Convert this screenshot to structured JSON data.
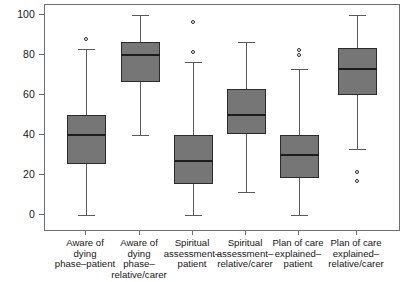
{
  "chart_data": {
    "type": "box",
    "title": "",
    "xlabel": "",
    "ylabel": "",
    "ylim": [
      0,
      100
    ],
    "yticks": [
      0,
      20,
      40,
      60,
      80,
      100
    ],
    "grid": false,
    "legend": "none",
    "categories": [
      "Aware of\ndying\nphase–patient",
      "Aware of\ndying\nphase–\nrelative/carer",
      "Spiritual\nassessment–\npatient",
      "Spiritual\nassessment–\nrelative/carer",
      "Plan of care\nexplained–\npatient",
      "Plan of care\nexplained–\nrelative/carer"
    ],
    "boxes": [
      {
        "name": "Aware of dying phase–patient",
        "whisker_low": 0,
        "q1": 25.5,
        "median": 40,
        "q3": 50,
        "whisker_high": 83,
        "outliers": [
          88
        ]
      },
      {
        "name": "Aware of dying phase–relative/carer",
        "whisker_low": 40,
        "q1": 66.5,
        "median": 80,
        "q3": 86.5,
        "whisker_high": 100,
        "outliers": []
      },
      {
        "name": "Spiritual assessment–patient",
        "whisker_low": 0,
        "q1": 15.5,
        "median": 27,
        "q3": 40,
        "whisker_high": 76.5,
        "outliers": [
          81.5,
          96.5
        ]
      },
      {
        "name": "Spiritual assessment–relative/carer",
        "whisker_low": 11.5,
        "q1": 40.5,
        "median": 50,
        "q3": 63,
        "whisker_high": 86.5,
        "outliers": []
      },
      {
        "name": "Plan of care explained–patient",
        "whisker_low": 0,
        "q1": 18.5,
        "median": 30,
        "q3": 40,
        "whisker_high": 73,
        "outliers": [
          80,
          82.5
        ]
      },
      {
        "name": "Plan of care explained–relative/carer",
        "whisker_low": 33,
        "q1": 60,
        "median": 73,
        "q3": 83.5,
        "whisker_high": 100,
        "outliers": [
          21.5,
          17
        ]
      }
    ],
    "colors": {
      "box_fill": "#767676",
      "box_edge": "#2b2b2b",
      "median": "#1d1d1d",
      "whisker": "#5a5a5a",
      "frame": "#6e6e6e",
      "text": "#171717",
      "background": "#ffffff"
    }
  }
}
